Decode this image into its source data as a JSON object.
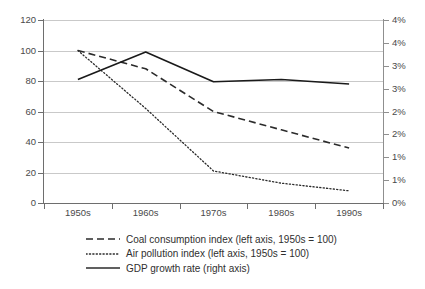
{
  "chart_data": {
    "type": "line",
    "title": "",
    "xlabel": "",
    "ylabel": "",
    "categories": [
      "1950s",
      "1960s",
      "1970s",
      "1980s",
      "1990s"
    ],
    "grid": true,
    "legend_position": "bottom",
    "left_axis": {
      "label": "",
      "ylim": [
        0,
        120
      ],
      "ticks": [
        0,
        20,
        40,
        60,
        80,
        100,
        120
      ],
      "tick_labels": [
        "0",
        "20",
        "40",
        "60",
        "80",
        "100",
        "120"
      ]
    },
    "right_axis": {
      "label": "",
      "ylim": [
        0,
        4
      ],
      "ticks": [
        0,
        0.5,
        1.0,
        1.5,
        2.0,
        2.5,
        3.0,
        3.5,
        4.0
      ],
      "tick_labels": [
        "0%",
        "1%",
        "1%",
        "2%",
        "2%",
        "3%",
        "3%",
        "4%"
      ],
      "unit": "%"
    },
    "series": [
      {
        "name": "Coal consumption index (left axis, 1950s = 100)",
        "axis": "left",
        "style": "dashed",
        "color": "#2b2b2b",
        "values": [
          100,
          88,
          60,
          48,
          36
        ]
      },
      {
        "name": "Air pollution index (left axis, 1950s = 100)",
        "axis": "left",
        "style": "dotted",
        "color": "#2b2b2b",
        "values": [
          100,
          62,
          21,
          13,
          8
        ]
      },
      {
        "name": "GDP growth rate (right axis)",
        "axis": "right",
        "style": "solid",
        "color": "#1a1a1a",
        "values": [
          2.7,
          3.3,
          2.65,
          2.7,
          2.6
        ]
      }
    ]
  },
  "legend": {
    "items": [
      {
        "label": "Coal consumption index (left axis, 1950s = 100)",
        "style": "dashed"
      },
      {
        "label": "Air pollution index (left axis, 1950s = 100)",
        "style": "dotted"
      },
      {
        "label": "GDP growth rate (right axis)",
        "style": "solid"
      }
    ]
  }
}
